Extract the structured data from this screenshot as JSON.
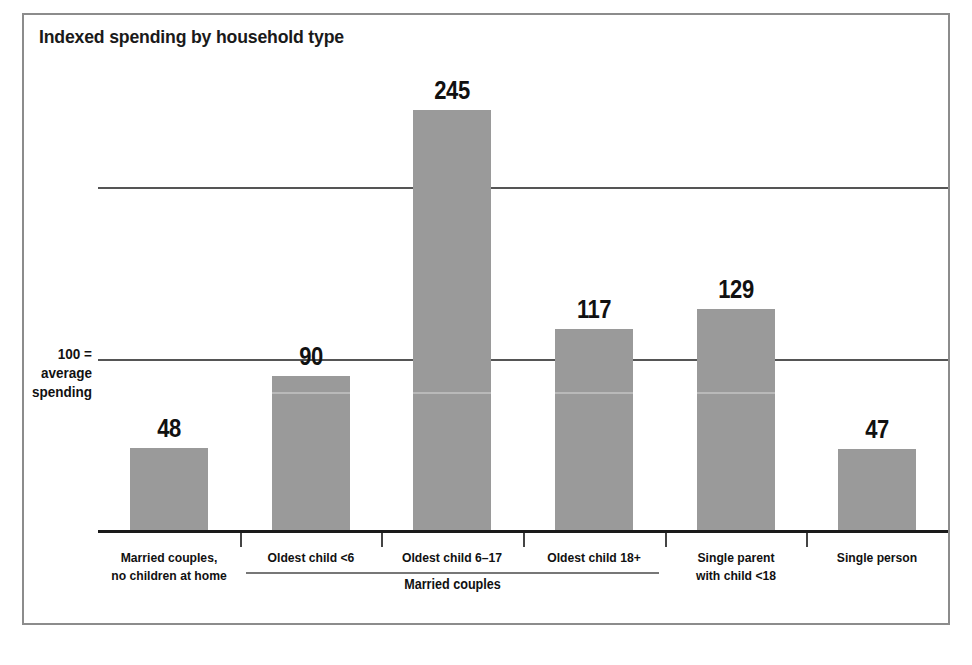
{
  "chart_data": {
    "type": "bar",
    "title": "Indexed spending by household type",
    "xlabel": "",
    "ylabel": "",
    "ylim": [
      0,
      270
    ],
    "grid": true,
    "gridlines": [
      100,
      200
    ],
    "legend": "none",
    "axis_note_lines": [
      "100 =",
      "average",
      "spending"
    ],
    "categories": [
      "Married couples,\nno children at home",
      "Oldest child <6",
      "Oldest child 6–17",
      "Oldest child 18+",
      "Single parent\nwith child <18",
      "Single person"
    ],
    "values": [
      48,
      90,
      245,
      117,
      129,
      47
    ],
    "value_labels": [
      "48",
      "90",
      "245",
      "117",
      "129",
      "47"
    ],
    "group_brackets": [
      {
        "label": "Married couples",
        "categories": [
          1,
          2,
          3
        ]
      }
    ],
    "colors": {
      "bar_fill": "#9a9a9a",
      "axis": "#1a1a1a",
      "gridline": "#555555",
      "text": "#111111",
      "frame": "#8c8c8c",
      "background": "#ffffff"
    }
  },
  "categories_display": [
    {
      "line1": "Married couples,",
      "line2": "no children at home"
    },
    {
      "line1": "Oldest child <6",
      "line2": ""
    },
    {
      "line1": "Oldest child 6–17",
      "line2": ""
    },
    {
      "line1": "Oldest child 18+",
      "line2": ""
    },
    {
      "line1": "Single parent",
      "line2": "with child <18"
    },
    {
      "line1": "Single person",
      "line2": ""
    }
  ],
  "axis_note": {
    "line1": "100 =",
    "line2": "average",
    "line3": "spending"
  },
  "group": {
    "label": "Married couples"
  }
}
